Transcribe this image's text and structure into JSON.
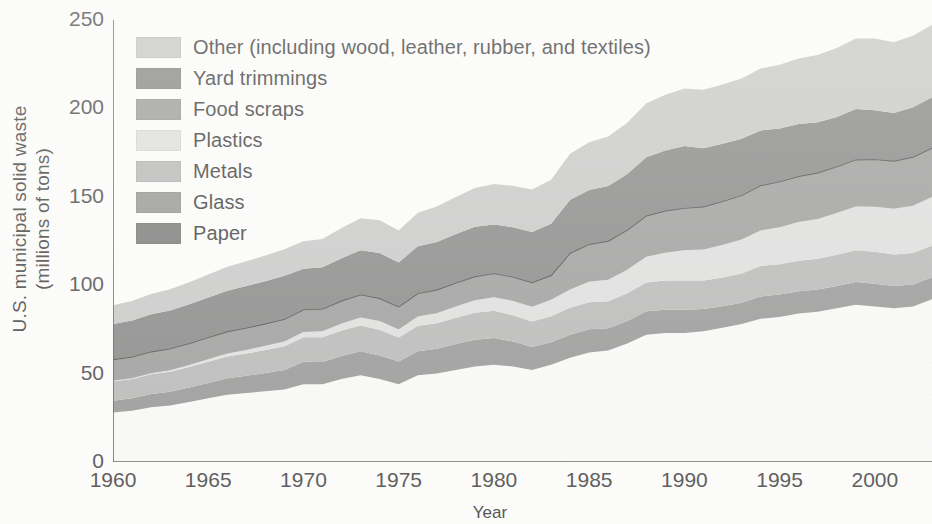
{
  "chart_data": {
    "type": "area",
    "title": "",
    "xlabel": "Year",
    "ylabel_line1": "U.S. municipal solid waste",
    "ylabel_line2": "(millions of tons)",
    "xlim": [
      1960,
      2003
    ],
    "ylim": [
      0,
      250
    ],
    "yticks": [
      0,
      50,
      100,
      150,
      200,
      250
    ],
    "yminor": [
      25,
      75,
      125,
      175,
      225
    ],
    "xticks": [
      1960,
      1965,
      1970,
      1975,
      1980,
      1985,
      1990,
      1995,
      2000
    ],
    "grid": false,
    "legend_position": "upper-left-inside",
    "stacked": true,
    "stack_order_bottom_to_top": [
      "Paper",
      "Glass",
      "Metals",
      "Plastics",
      "Food scraps",
      "Yard trimmings",
      "Other (including wood, leather, rubber, and textiles)"
    ],
    "x": [
      1960,
      1961,
      1962,
      1963,
      1964,
      1965,
      1966,
      1967,
      1968,
      1969,
      1970,
      1971,
      1972,
      1973,
      1974,
      1975,
      1976,
      1977,
      1978,
      1979,
      1980,
      1981,
      1982,
      1983,
      1984,
      1985,
      1986,
      1987,
      1988,
      1989,
      1990,
      1991,
      1992,
      1993,
      1994,
      1995,
      1996,
      1997,
      1998,
      1999,
      2000,
      2001,
      2002,
      2003
    ],
    "series": [
      {
        "name": "Paper",
        "color": "#6e6e6e",
        "values": [
          28,
          29,
          31,
          32,
          34,
          36,
          38,
          39,
          40,
          41,
          44,
          44,
          47,
          49,
          47,
          44,
          49,
          50,
          52,
          54,
          55,
          54,
          52,
          55,
          59,
          62,
          63,
          67,
          72,
          73,
          73,
          74,
          76,
          78,
          81,
          82,
          84,
          85,
          87,
          89,
          88,
          87,
          88,
          92
        ]
      },
      {
        "name": "Glass",
        "color": "#8e8e8e",
        "values": [
          6.7,
          7,
          7.4,
          7.7,
          8.1,
          8.7,
          9.3,
          9.8,
          10.3,
          11,
          12.7,
          12.6,
          13,
          13.6,
          13.3,
          12.8,
          13.6,
          14,
          14.7,
          15.2,
          15.1,
          14.2,
          13.1,
          12.8,
          13,
          13.1,
          12.6,
          12.7,
          13.2,
          13.1,
          13.1,
          12.5,
          12.1,
          12.1,
          12.6,
          12.8,
          12.6,
          12.5,
          12.6,
          12.8,
          12.8,
          12.5,
          12.4,
          12.5
        ]
      },
      {
        "name": "Metals",
        "color": "#b2b2b2",
        "values": [
          10.8,
          10.9,
          11.2,
          11.4,
          11.7,
          12,
          12.4,
          12.6,
          13,
          13.4,
          13.8,
          13.9,
          14.4,
          14.6,
          14.5,
          13.6,
          14.4,
          14.5,
          14.9,
          15.2,
          15.5,
          14.8,
          14.3,
          14.6,
          15.2,
          15.3,
          15.3,
          15.8,
          16.3,
          16.6,
          16.6,
          16.1,
          16.2,
          16.5,
          17.3,
          17.1,
          17.2,
          17.4,
          17.6,
          18,
          18.1,
          17.8,
          17.8,
          18
        ]
      },
      {
        "name": "Plastics",
        "color": "#dcdcdc",
        "values": [
          0.4,
          0.5,
          0.6,
          0.8,
          1,
          1.4,
          1.7,
          2,
          2.4,
          2.8,
          3,
          3.4,
          4,
          4.6,
          4.9,
          4.5,
          5.3,
          5.7,
          6.4,
          7.1,
          7.6,
          8.1,
          8.4,
          9.3,
          10.3,
          11.5,
          12.2,
          13.2,
          14.6,
          15.6,
          17.1,
          17.6,
          18.5,
          19.2,
          20.1,
          20.9,
          21.9,
          22.6,
          23.6,
          24.7,
          25.5,
          25.9,
          26.7,
          27.4
        ]
      },
      {
        "name": "Food scraps",
        "color": "#949494",
        "values": [
          12.2,
          12.2,
          12.3,
          12.3,
          12.4,
          12.5,
          12.5,
          12.6,
          12.6,
          12.7,
          12.8,
          12.8,
          12.9,
          13,
          13,
          13,
          13.2,
          13.3,
          13.4,
          13.5,
          13.6,
          13.7,
          13.8,
          14,
          20.8,
          21.4,
          22,
          22.7,
          23.3,
          23.9,
          23.9,
          24.3,
          24.7,
          25.1,
          25.5,
          25.9,
          26,
          26.2,
          26.4,
          26.6,
          26.9,
          27.2,
          27.7,
          27.9
        ]
      },
      {
        "name": "Yard trimmings",
        "color": "#7d7d7d",
        "values": [
          20,
          20.5,
          21,
          21.5,
          22,
          22.5,
          23,
          23.5,
          24,
          24.5,
          23,
          23.5,
          24,
          25,
          25.5,
          25,
          26.5,
          27,
          27.5,
          28,
          27.5,
          28,
          28.5,
          29,
          30,
          30.5,
          31,
          31.5,
          33,
          34,
          35,
          33,
          32.5,
          32,
          31,
          30,
          29.5,
          28.5,
          28,
          28.5,
          27.7,
          27,
          28,
          28.5
        ]
      },
      {
        "name": "Other (including wood, leather, rubber, and textiles)",
        "color": "#c4c4c4",
        "values": [
          10.5,
          11,
          11.5,
          12,
          12.5,
          13,
          13.5,
          14,
          14.5,
          15,
          15.5,
          16,
          17,
          18,
          18.5,
          18,
          19,
          20,
          21,
          22,
          23,
          23.5,
          24,
          25,
          26,
          27,
          28,
          29,
          30.5,
          31.5,
          32.5,
          33,
          33.5,
          34,
          35,
          36,
          37,
          38,
          39,
          40,
          40.5,
          40,
          40.5,
          41
        ]
      }
    ],
    "total_values": [
      88.5,
      91.1,
      95,
      97.7,
      101.7,
      106.1,
      110.4,
      113.5,
      116.8,
      120.4,
      124.8,
      126.2,
      132.3,
      143.8,
      140.7,
      130.9,
      141,
      144.5,
      150.9,
      155,
      157.3,
      156.3,
      154.1,
      159.7,
      174.3,
      180.8,
      184.1,
      192.9,
      202.9,
      207.7,
      211.2,
      211,
      213.5,
      216.9,
      222.5,
      224.7,
      228.2,
      230.2,
      234.2,
      239.6,
      239.5,
      237.4,
      241.1,
      247.3
    ]
  },
  "legend": {
    "items": [
      {
        "label": "Other (including wood, leather, rubber, and textiles)",
        "color": "#c4c4c4"
      },
      {
        "label": "Yard trimmings",
        "color": "#7d7d7d"
      },
      {
        "label": "Food scraps",
        "color": "#949494"
      },
      {
        "label": "Plastics",
        "color": "#dcdcdc"
      },
      {
        "label": "Metals",
        "color": "#b2b2b2"
      },
      {
        "label": "Glass",
        "color": "#8e8e8e"
      },
      {
        "label": "Paper",
        "color": "#6e6e6e"
      }
    ]
  },
  "axes": {
    "y_label_line1": "U.S. municipal solid waste",
    "y_label_line2": "(millions of tons)",
    "x_label": "Year",
    "y_tick_labels": [
      "250",
      "200",
      "150",
      "100",
      "50",
      "0"
    ],
    "x_tick_labels": [
      "1960",
      "1965",
      "1970",
      "1975",
      "1980",
      "1985",
      "1990",
      "1995",
      "2000"
    ]
  },
  "colors": {
    "axis": "#4a4a4a",
    "outline": "#3d3d3d",
    "background": "#fdfdfc"
  }
}
